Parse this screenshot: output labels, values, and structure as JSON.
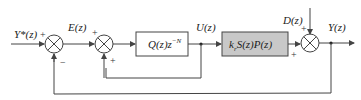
{
  "diagram": {
    "type": "feedback-block-diagram",
    "signals": {
      "reference": "Y*(z)",
      "error": "E(z)",
      "control": "U(z)",
      "disturbance": "D(z)",
      "output": "Y(z)"
    },
    "blocks": [
      {
        "id": "repetitive-controller",
        "label": "Q(z)z",
        "superscript": "−N",
        "fill": "#ffffff"
      },
      {
        "id": "plant",
        "label": "k",
        "subscript": "r",
        "label_rest": "S(z)P(z)",
        "fill": "#c8c8c8"
      }
    ],
    "junctions": [
      {
        "id": "sum1",
        "signs": {
          "left": "+",
          "bottom": "−"
        }
      },
      {
        "id": "sum2",
        "signs": {
          "left": "+",
          "bottom": "+"
        }
      },
      {
        "id": "sum3",
        "signs": {
          "top": "+",
          "left": "+"
        }
      }
    ],
    "colors": {
      "line": "#444444",
      "plant_fill": "#c8c8c8",
      "background": "#ffffff"
    }
  }
}
